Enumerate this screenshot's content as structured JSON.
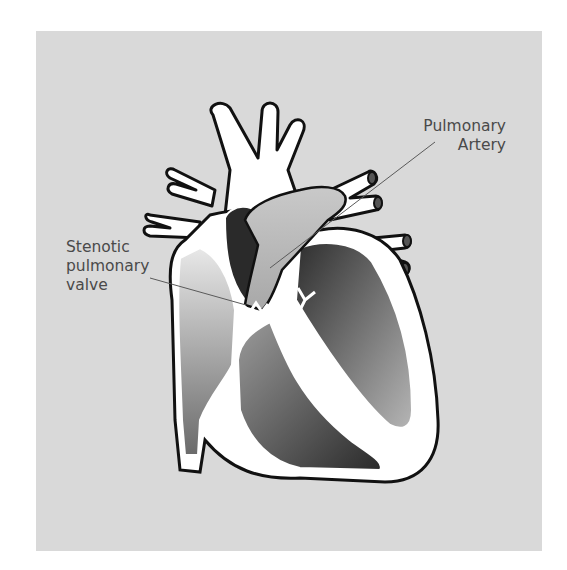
{
  "diagram": {
    "background_color": "#d9d9d9",
    "labels": [
      {
        "id": "pulmonary-artery",
        "lines": [
          "Pulmonary",
          "Artery"
        ]
      },
      {
        "id": "stenotic-pulmonary-valve",
        "lines": [
          "Stenotic",
          "pulmonary",
          "valve"
        ]
      }
    ]
  },
  "labels": {
    "pulmonary_artery": "Pulmonary\nArtery",
    "stenotic_valve": "Stenotic\npulmonary\nvalve"
  }
}
